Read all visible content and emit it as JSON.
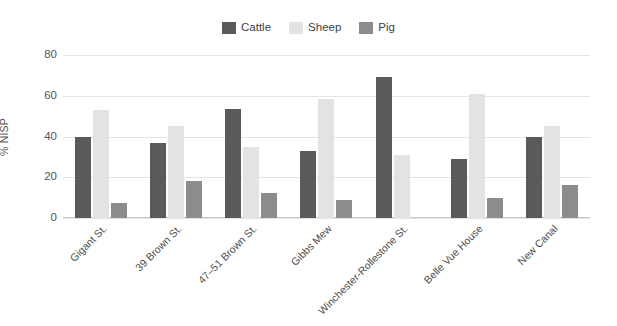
{
  "chart_data": {
    "type": "bar",
    "title": "",
    "subtitle": "",
    "xlabel": "",
    "ylabel": "% NISP",
    "ylim": [
      0,
      80
    ],
    "yticks": [
      0,
      20,
      40,
      60,
      80
    ],
    "ytick_labels": [
      "0",
      "20",
      "40",
      "60",
      "80"
    ],
    "grid": true,
    "legend_position": "top-center",
    "categories": [
      "Gigant St.",
      "39 Brown St.",
      "47–51 Brown St.",
      "Gibbs Mew",
      "Winchester-Rollestone St.",
      "Belle Vue House",
      "New Canal"
    ],
    "series": [
      {
        "name": "Cattle",
        "color": "#5a5a5a",
        "values": [
          40,
          37,
          53.5,
          33,
          69,
          29,
          40
        ]
      },
      {
        "name": "Sheep",
        "color": "#e3e3e3",
        "values": [
          53,
          45,
          35,
          58.5,
          31,
          61,
          45
        ]
      },
      {
        "name": "Pig",
        "color": "#8c8c8c",
        "values": [
          7.5,
          18,
          12.5,
          9,
          0,
          10,
          16
        ]
      }
    ]
  },
  "legend": {
    "items": [
      {
        "label": "Cattle",
        "color": "#5a5a5a"
      },
      {
        "label": "Sheep",
        "color": "#e3e3e3"
      },
      {
        "label": "Pig",
        "color": "#8c8c8c"
      }
    ]
  },
  "colors": {
    "background": "#ffffff",
    "gridline": "#e4e4e4",
    "axis": "#c9c9c9",
    "text": "#4f4f4f"
  }
}
